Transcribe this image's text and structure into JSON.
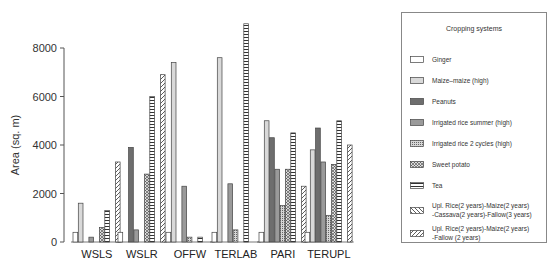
{
  "chart_data": {
    "type": "bar",
    "title": "",
    "xlabel": "",
    "ylabel": "Area (sq. m)",
    "ylim": [
      0,
      9000
    ],
    "yticks": [
      0,
      2000,
      4000,
      6000,
      8000
    ],
    "grid": false,
    "legend_position": "right",
    "legend_title": "Cropping systems",
    "categories": [
      "WSLS",
      "WSLR",
      "OFFW",
      "TERLAB",
      "PARI",
      "TERUPL"
    ],
    "series": [
      {
        "name": "Ginger",
        "pattern": "white",
        "values": [
          400,
          400,
          400,
          400,
          400,
          400
        ]
      },
      {
        "name": "Maize–maize (high)",
        "pattern": "light-gray",
        "values": [
          1600,
          0,
          7400,
          7600,
          5000,
          3800
        ]
      },
      {
        "name": "Peanuts",
        "pattern": "dark-gray",
        "values": [
          0,
          3900,
          0,
          0,
          4300,
          4700
        ]
      },
      {
        "name": "Irrigated rice summer (high)",
        "pattern": "mid-gray",
        "values": [
          200,
          500,
          2300,
          2400,
          3000,
          3300
        ]
      },
      {
        "name": "Irrigated rice 2 cycles (high)",
        "pattern": "fine-dots",
        "values": [
          0,
          0,
          200,
          500,
          1500,
          1100
        ]
      },
      {
        "name": "Sweet potato",
        "pattern": "crosshatch",
        "values": [
          600,
          2800,
          0,
          0,
          3000,
          3200
        ]
      },
      {
        "name": "Tea",
        "pattern": "horizontal-ladder",
        "values": [
          1300,
          6000,
          200,
          9000,
          4500,
          5000
        ]
      },
      {
        "name": "Upl. Rice(2 years)-Maize(2 years) -Cassava(2 years)-Fallow(3 years)",
        "pattern": "diag-down",
        "values": [
          0,
          0,
          0,
          0,
          0,
          0
        ]
      },
      {
        "name": "Upl. Rice(2 years)-Maize(2 years) -Fallow (2 years)",
        "pattern": "diag-up",
        "values": [
          3300,
          6900,
          0,
          0,
          2300,
          4000
        ]
      }
    ]
  },
  "legend": {
    "title": "Cropping systems",
    "items": [
      {
        "label": "Ginger"
      },
      {
        "label": "Maize–maize (high)"
      },
      {
        "label": "Peanuts"
      },
      {
        "label": "Irrigated rice summer (high)"
      },
      {
        "label": "Irrigated rice 2 cycles (high)"
      },
      {
        "label": "Sweet potato"
      },
      {
        "label": "Tea"
      },
      {
        "label": "Upl. Rice(2 years)-Maize(2 years)\n-Cassava(2 years)-Fallow(3 years)"
      },
      {
        "label": "Upl. Rice(2 years)-Maize(2 years)\n-Fallow (2 years)"
      }
    ]
  }
}
